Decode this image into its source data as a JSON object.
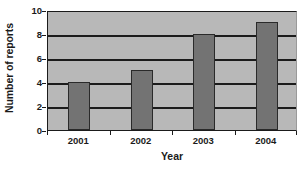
{
  "chart_data": {
    "type": "bar",
    "title": "",
    "categories": [
      "2001",
      "2002",
      "2003",
      "2004"
    ],
    "values": [
      4,
      5,
      8,
      9
    ],
    "series": [
      {
        "name": "Number of reports",
        "values": [
          4,
          5,
          8,
          9
        ]
      }
    ],
    "xlabel": "Year",
    "ylabel": "Number of reports",
    "ylim": [
      0,
      10
    ],
    "ytick_labels": [
      "0",
      "2",
      "4",
      "6",
      "8",
      "10"
    ],
    "ytick_values": [
      0,
      2,
      4,
      6,
      8,
      10
    ],
    "grid": "horizontal",
    "legend": "none",
    "colors": {
      "bar_fill": "#737373",
      "bar_edge": "#2a2a2a",
      "plot_background": "#b8b8b8",
      "axis": "#1b1b1b",
      "gridline": "#1b1b1b",
      "page_background": "#ffffff",
      "text": "#1b1b1b"
    }
  }
}
